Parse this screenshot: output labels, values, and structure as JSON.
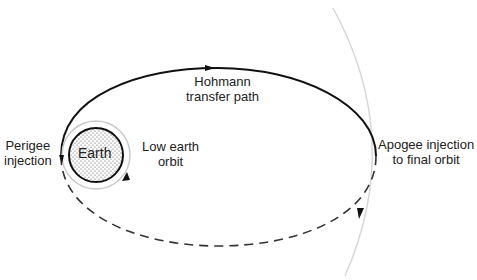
{
  "diagram": {
    "type": "orbital-transfer",
    "labels": {
      "earth": "Earth",
      "low_earth_orbit": [
        "Low earth",
        "orbit"
      ],
      "perigee": [
        "Perigee",
        "injection"
      ],
      "hohmann": [
        "Hohmann",
        "transfer path"
      ],
      "apogee": [
        "Apogee injection",
        "to final orbit"
      ]
    },
    "colors": {
      "transfer_path": "#111111",
      "final_orbit": "#d8d8d8",
      "low_orbit": "#c8c8c8",
      "earth_fill": "#ffffff",
      "earth_dots": "#444444"
    }
  }
}
